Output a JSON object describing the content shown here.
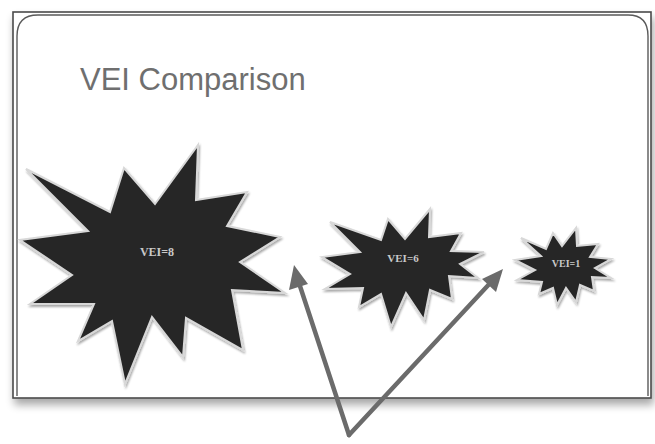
{
  "slide": {
    "title": "VEI Comparison"
  },
  "colors": {
    "star_fill": "#262626",
    "star_outline": "#d8d8d8",
    "arrow": "#6b6b6b",
    "frame": "#4a4a4a",
    "title": "#6f6f6f",
    "label": "#c9c9c9"
  },
  "shapes": [
    {
      "id": "vei-8",
      "label": "VEI=8",
      "vei": 8
    },
    {
      "id": "vei-6",
      "label": "VEI=6",
      "vei": 6
    },
    {
      "id": "vei-1",
      "label": "VEI=1",
      "vei": 1
    }
  ],
  "arrows": {
    "count": 2,
    "description": "Two arrows from a common point below the slide pointing up toward the gaps after VEI=8 and VEI=6"
  }
}
